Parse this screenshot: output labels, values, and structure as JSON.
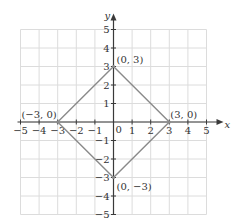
{
  "chart_data": {
    "type": "line",
    "title": "",
    "xlabel": "x",
    "ylabel": "y",
    "xlim": [
      -5,
      5
    ],
    "ylim": [
      -5,
      5
    ],
    "grid": true,
    "x_ticks": [
      -5,
      -4,
      -3,
      -2,
      -1,
      0,
      1,
      2,
      3,
      4,
      5
    ],
    "y_ticks": [
      -5,
      -4,
      -3,
      -2,
      -1,
      1,
      2,
      3,
      4,
      5
    ],
    "origin_label": "0",
    "series": [
      {
        "name": "diamond |x| + |y| = 3",
        "closed": true,
        "points": [
          [
            0,
            3
          ],
          [
            3,
            0
          ],
          [
            0,
            -3
          ],
          [
            -3,
            0
          ]
        ]
      }
    ],
    "annotations": [
      {
        "x": 0,
        "y": 3,
        "text": "(0, 3)"
      },
      {
        "x": 3,
        "y": 0,
        "text": "(3, 0)"
      },
      {
        "x": 0,
        "y": -3,
        "text": "(0, −3)"
      },
      {
        "x": -3,
        "y": 0,
        "text": "(−3, 0)"
      }
    ],
    "colors": {
      "grid": "#dcdcdc",
      "axis": "#3a3a3a",
      "line": "#8a8a8a",
      "text": "#333333"
    }
  }
}
